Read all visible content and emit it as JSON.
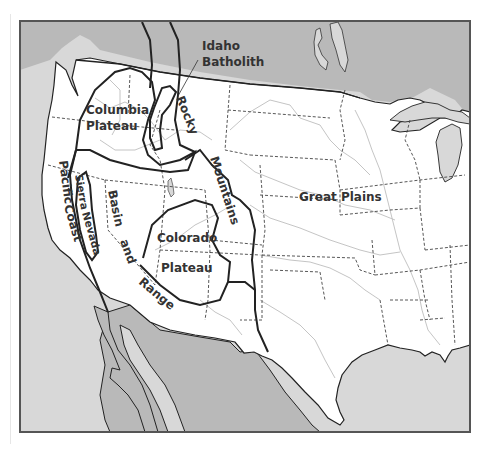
{
  "caption": "",
  "map": {
    "title": "Physiographic regions of the western United States",
    "colors": {
      "us_land": "#ffffff",
      "foreign_land": "#b9b9b9",
      "water": "#d8d8d8",
      "region_border": "#222222",
      "state_border": "#444444",
      "river": "#bdbdbd",
      "frame": "#555555"
    },
    "regions": [
      {
        "id": "idaho-batholith",
        "label_line1": "Idaho",
        "label_line2": "Batholith"
      },
      {
        "id": "columbia-plateau",
        "label_line1": "Columbia",
        "label_line2": "Plateau"
      },
      {
        "id": "rocky",
        "label": "Rocky"
      },
      {
        "id": "mountains",
        "label": "Mountains"
      },
      {
        "id": "pacific",
        "label": "Pacific"
      },
      {
        "id": "coast",
        "label": "Coast"
      },
      {
        "id": "sierra",
        "label": "Sierra"
      },
      {
        "id": "nevada",
        "label": "Nevada"
      },
      {
        "id": "basin",
        "label": "Basin"
      },
      {
        "id": "and",
        "label": "and"
      },
      {
        "id": "range",
        "label": "Range"
      },
      {
        "id": "colorado-plateau",
        "label_line1": "Colorado",
        "label_line2": "Plateau"
      },
      {
        "id": "great-plains",
        "label": "Great Plains"
      }
    ]
  }
}
